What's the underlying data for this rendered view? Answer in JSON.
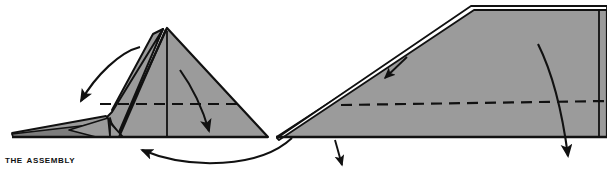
{
  "page": {
    "width": 607,
    "height": 173,
    "background_color": "#ffffff"
  },
  "caption": {
    "text": "The Assembly",
    "display_text": "THE ASSEMBLY",
    "style": "bold-small-caps",
    "color": "#111111"
  },
  "colors": {
    "paper_fill": "#9b9b9b",
    "paper_fill_shadow": "#7d7d7d",
    "outline": "#111111",
    "fold_line": "#111111",
    "arrow": "#111111",
    "background": "#ffffff"
  },
  "figures": [
    {
      "name": "left-figure",
      "label": "folded-plane-side-view-step-1",
      "description": "Side view of a folded paper plane with tall triangular wing, nose tip at left, dashed horizontal fold line across the middle"
    },
    {
      "name": "right-figure",
      "label": "folded-plane-side-view-step-2",
      "description": "Side view of the flattened wedge-shaped paper plane with long sloping top edge and dashed horizontal fold line"
    }
  ],
  "annotations": [
    {
      "name": "arrow-fold-wing-down-left",
      "type": "curved-arrow",
      "direction": "down-left",
      "figure": "left-figure"
    },
    {
      "name": "arrow-fold-wing-down-right",
      "type": "curved-arrow",
      "direction": "down",
      "figure": "left-figure"
    },
    {
      "name": "arrow-result-pointer",
      "type": "curved-arrow",
      "direction": "left",
      "figure": "left-figure"
    },
    {
      "name": "arrow-crease-pointer",
      "type": "straight-arrow",
      "direction": "down-left",
      "figure": "right-figure"
    },
    {
      "name": "arrow-nose-pointer",
      "type": "straight-arrow",
      "direction": "down-right",
      "figure": "right-figure"
    },
    {
      "name": "arrow-fold-down",
      "type": "curved-arrow",
      "direction": "down",
      "figure": "right-figure"
    }
  ]
}
